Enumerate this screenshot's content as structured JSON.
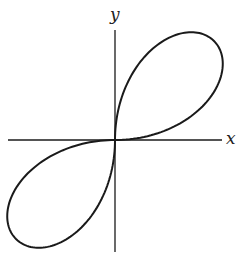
{
  "diagram": {
    "type": "polar-curve",
    "axes": {
      "x_label": "x",
      "y_label": "y",
      "origin_px": [
        115,
        140
      ],
      "x_axis_px": [
        8,
        222
      ],
      "y_axis_px": [
        30,
        252
      ]
    },
    "curve": {
      "equation": "r = sin(2θ)",
      "scale_px": 140,
      "color": "#1a1a1a",
      "stroke_width": 2
    },
    "axis_color": "#1a1a1a"
  }
}
